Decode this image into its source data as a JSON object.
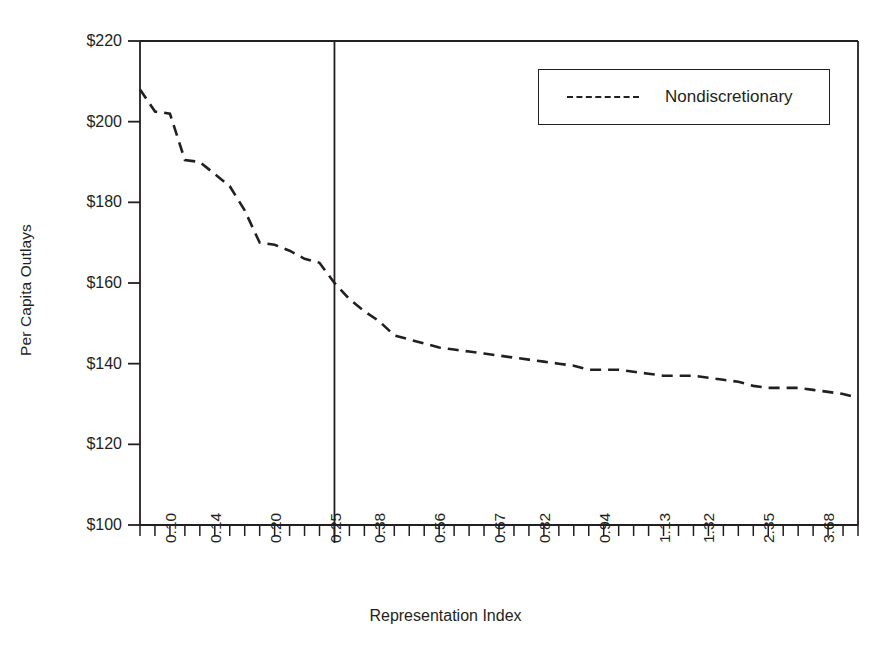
{
  "chart_data": {
    "type": "line",
    "title": "",
    "xlabel": "Representation Index",
    "ylabel": "Per Capita Outlays",
    "ylim": [
      100,
      220
    ],
    "ytick_labels": [
      "$220",
      "$200",
      "$180",
      "$160",
      "$140",
      "$120",
      "$100"
    ],
    "ytick_values": [
      220,
      200,
      180,
      160,
      140,
      120,
      100
    ],
    "xtick_labels": [
      "0.10",
      "0.14",
      "0.20",
      "0.25",
      "0.38",
      "0.56",
      "0.67",
      "0.82",
      "0.94",
      "1.13",
      "1.32",
      "2.35",
      "3.68"
    ],
    "grid": false,
    "legend_position": "top-right",
    "reference_line": {
      "x_index": 13,
      "label": ""
    },
    "series": [
      {
        "name": "Nondiscretionary",
        "style": "dashed",
        "color": "#231f20",
        "values": [
          208.0,
          202.5,
          202.0,
          190.5,
          190.0,
          187.0,
          184.0,
          178.0,
          170.0,
          169.5,
          168.0,
          166.0,
          165.0,
          160.0,
          156.0,
          153.0,
          150.5,
          147.0,
          146.0,
          145.0,
          144.0,
          143.5,
          143.0,
          142.5,
          142.0,
          141.5,
          141.0,
          140.5,
          140.0,
          139.5,
          138.5,
          138.5,
          138.5,
          138.0,
          137.5,
          137.0,
          137.0,
          137.0,
          136.5,
          136.0,
          135.5,
          134.5,
          134.0,
          134.0,
          134.0,
          133.5,
          133.0,
          132.5,
          131.5
        ]
      }
    ]
  },
  "legend": {
    "entries": [
      {
        "label": "Nondiscretionary",
        "dash": "dashed"
      }
    ]
  },
  "axes": {
    "x_title": "Representation Index",
    "y_title": "Per Capita Outlays"
  }
}
